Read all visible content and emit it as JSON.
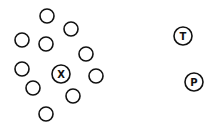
{
  "diagram": {
    "title": "",
    "empty_circle_count": 10,
    "labeled_nodes": [
      {
        "id": "x",
        "label": "X",
        "role": "center-of-cluster"
      },
      {
        "id": "t",
        "label": "T",
        "role": "separate"
      },
      {
        "id": "p",
        "label": "P",
        "role": "separate"
      }
    ],
    "colors": {
      "stroke": "#111111",
      "fill": "#ffffff"
    }
  }
}
